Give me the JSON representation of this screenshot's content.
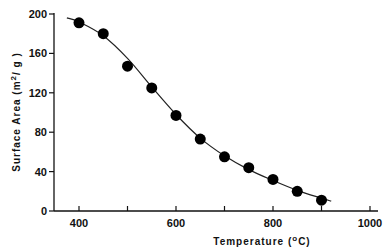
{
  "chart_data": {
    "type": "scatter",
    "title": "",
    "xlabel": "Temperature (°C)",
    "ylabel": "Surface Area (m²/g)",
    "xlabel_parts": {
      "text": "Temperature (",
      "sup": "o",
      "unit": "C)"
    },
    "ylabel_parts": {
      "text": "Surface Area  (m",
      "sup": "2",
      "unit": "/ g )"
    },
    "xlim": [
      350,
      1000
    ],
    "ylim": [
      0,
      200
    ],
    "x_ticks": [
      400,
      500,
      600,
      700,
      800,
      900,
      1000
    ],
    "x_tick_labels": [
      "400",
      "",
      "600",
      "",
      "800",
      "",
      "1000"
    ],
    "y_ticks": [
      0,
      40,
      80,
      120,
      160,
      200
    ],
    "y_tick_labels": [
      "0",
      "40",
      "80",
      "120",
      "160",
      "200"
    ],
    "grid": false,
    "legend": null,
    "series": [
      {
        "name": "Surface area (measured)",
        "marker": "filled-circle",
        "x": [
          400,
          450,
          500,
          550,
          600,
          650,
          700,
          750,
          800,
          850,
          900
        ],
        "y": [
          191,
          180,
          147,
          125,
          97,
          73,
          55,
          44,
          32,
          20,
          11
        ]
      },
      {
        "name": "Fitted curve",
        "marker": "line",
        "x": [
          375,
          400,
          450,
          500,
          550,
          600,
          650,
          700,
          750,
          800,
          850,
          900,
          920
        ],
        "y": [
          196,
          192,
          178,
          155,
          126,
          98,
          74,
          56,
          42,
          31,
          21,
          13,
          10
        ]
      }
    ],
    "colors": {
      "marker": "#000000",
      "line": "#222222",
      "axis": "#111111"
    }
  }
}
